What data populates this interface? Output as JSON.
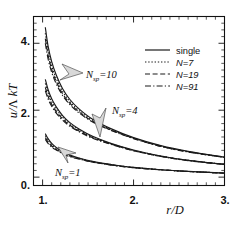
{
  "chart_data": {
    "type": "line",
    "title": "",
    "xlabel": "r/D",
    "ylabel": "u/Λ kT",
    "xlim": [
      0.9,
      3.0
    ],
    "ylim": [
      -0.25,
      4.8
    ],
    "xticks": [
      "1.",
      "2.",
      "3."
    ],
    "xtick_values": [
      1,
      2,
      3
    ],
    "yticks": [
      "0.",
      "2.",
      "4."
    ],
    "ytick_values": [
      0,
      2,
      4
    ],
    "grid": false,
    "legend_position": "upper-right",
    "minor_ticks": true,
    "legend": [
      {
        "label": "single",
        "style": "solid"
      },
      {
        "label": "N=7",
        "style": "dotted"
      },
      {
        "label": "N=19",
        "style": "dashed"
      },
      {
        "label": "N=91",
        "style": "dashdot"
      }
    ],
    "annotations": [
      {
        "text": "N",
        "sub": "sp",
        "eq": "=10",
        "x": 1.42,
        "y": 2.92
      },
      {
        "text": "N",
        "sub": "sp",
        "eq": "=4",
        "x": 2.02,
        "y": 1.88
      },
      {
        "text": "N",
        "sub": "sp",
        "eq": "=1",
        "x": 1.22,
        "y": 0.3
      }
    ],
    "series": [
      {
        "name": "Nsp=10, single",
        "group": "Nsp=10",
        "style": "solid",
        "x": [
          1.03,
          1.06,
          1.1,
          1.15,
          1.22,
          1.3,
          1.4,
          1.55,
          1.75,
          2.0,
          2.3,
          2.6,
          3.0
        ],
        "y": [
          4.48,
          3.92,
          3.45,
          3.05,
          2.64,
          2.32,
          2.04,
          1.73,
          1.45,
          1.18,
          0.94,
          0.77,
          0.6
        ]
      },
      {
        "name": "Nsp=10, N=7",
        "group": "Nsp=10",
        "style": "dotted",
        "x": [
          1.03,
          1.06,
          1.1,
          1.15,
          1.22,
          1.3,
          1.4,
          1.55,
          1.75,
          2.0,
          2.3,
          2.6,
          3.0
        ],
        "y": [
          4.3,
          3.78,
          3.33,
          2.95,
          2.56,
          2.26,
          1.99,
          1.7,
          1.43,
          1.17,
          0.93,
          0.76,
          0.59
        ]
      },
      {
        "name": "Nsp=10, N=19",
        "group": "Nsp=10",
        "style": "dashed",
        "x": [
          1.03,
          1.06,
          1.1,
          1.15,
          1.22,
          1.3,
          1.4,
          1.55,
          1.75,
          2.0,
          2.3,
          2.6,
          3.0
        ],
        "y": [
          4.14,
          3.65,
          3.22,
          2.86,
          2.49,
          2.21,
          1.95,
          1.67,
          1.41,
          1.16,
          0.92,
          0.76,
          0.59
        ]
      },
      {
        "name": "Nsp=10, N=91",
        "group": "Nsp=10",
        "style": "dashdot",
        "x": [
          1.03,
          1.06,
          1.1,
          1.15,
          1.22,
          1.3,
          1.4,
          1.55,
          1.75,
          2.0,
          2.3,
          2.6,
          3.0
        ],
        "y": [
          4.0,
          3.54,
          3.13,
          2.79,
          2.44,
          2.17,
          1.92,
          1.65,
          1.4,
          1.15,
          0.92,
          0.75,
          0.59
        ]
      },
      {
        "name": "Nsp=4, single",
        "group": "Nsp=4",
        "style": "solid",
        "x": [
          1.03,
          1.06,
          1.1,
          1.15,
          1.22,
          1.3,
          1.4,
          1.55,
          1.75,
          2.0,
          2.3,
          2.6,
          3.0
        ],
        "y": [
          2.92,
          2.62,
          2.34,
          2.1,
          1.84,
          1.63,
          1.44,
          1.22,
          1.01,
          0.81,
          0.63,
          0.5,
          0.38
        ]
      },
      {
        "name": "Nsp=4, N=7",
        "group": "Nsp=4",
        "style": "dotted",
        "x": [
          1.03,
          1.06,
          1.1,
          1.15,
          1.22,
          1.3,
          1.4,
          1.55,
          1.75,
          2.0,
          2.3,
          2.6,
          3.0
        ],
        "y": [
          2.8,
          2.52,
          2.26,
          2.03,
          1.79,
          1.59,
          1.41,
          1.2,
          1.0,
          0.8,
          0.63,
          0.5,
          0.38
        ]
      },
      {
        "name": "Nsp=4, N=19",
        "group": "Nsp=4",
        "style": "dashed",
        "x": [
          1.03,
          1.06,
          1.1,
          1.15,
          1.22,
          1.3,
          1.4,
          1.55,
          1.75,
          2.0,
          2.3,
          2.6,
          3.0
        ],
        "y": [
          2.68,
          2.42,
          2.18,
          1.96,
          1.74,
          1.55,
          1.38,
          1.18,
          0.99,
          0.79,
          0.62,
          0.5,
          0.38
        ]
      },
      {
        "name": "Nsp=4, N=91",
        "group": "Nsp=4",
        "style": "dashdot",
        "x": [
          1.03,
          1.06,
          1.1,
          1.15,
          1.22,
          1.3,
          1.4,
          1.55,
          1.75,
          2.0,
          2.3,
          2.6,
          3.0
        ],
        "y": [
          2.58,
          2.34,
          2.12,
          1.91,
          1.7,
          1.52,
          1.36,
          1.16,
          0.98,
          0.79,
          0.62,
          0.49,
          0.38
        ]
      },
      {
        "name": "Nsp=1, single",
        "group": "Nsp=1",
        "style": "solid",
        "x": [
          1.03,
          1.06,
          1.1,
          1.15,
          1.22,
          1.3,
          1.4,
          1.55,
          1.75,
          2.0,
          2.3,
          2.6,
          3.0
        ],
        "y": [
          1.3,
          1.15,
          1.01,
          0.89,
          0.76,
          0.66,
          0.57,
          0.47,
          0.38,
          0.29,
          0.22,
          0.17,
          0.12
        ]
      },
      {
        "name": "Nsp=1, N=7",
        "group": "Nsp=1",
        "style": "dotted",
        "x": [
          1.03,
          1.06,
          1.1,
          1.15,
          1.22,
          1.3,
          1.4,
          1.55,
          1.75,
          2.0,
          2.3,
          2.6,
          3.0
        ],
        "y": [
          1.24,
          1.1,
          0.97,
          0.86,
          0.74,
          0.64,
          0.56,
          0.46,
          0.37,
          0.29,
          0.22,
          0.17,
          0.12
        ]
      },
      {
        "name": "Nsp=1, N=19",
        "group": "Nsp=1",
        "style": "dashed",
        "x": [
          1.03,
          1.06,
          1.1,
          1.15,
          1.22,
          1.3,
          1.4,
          1.55,
          1.75,
          2.0,
          2.3,
          2.6,
          3.0
        ],
        "y": [
          1.18,
          1.05,
          0.93,
          0.83,
          0.72,
          0.63,
          0.55,
          0.45,
          0.37,
          0.28,
          0.22,
          0.17,
          0.12
        ]
      },
      {
        "name": "Nsp=1, N=91",
        "group": "Nsp=1",
        "style": "dashdot",
        "x": [
          1.03,
          1.06,
          1.1,
          1.15,
          1.22,
          1.3,
          1.4,
          1.55,
          1.75,
          2.0,
          2.3,
          2.6,
          3.0
        ],
        "y": [
          1.13,
          1.01,
          0.9,
          0.81,
          0.7,
          0.61,
          0.54,
          0.45,
          0.36,
          0.28,
          0.22,
          0.17,
          0.12
        ]
      }
    ]
  },
  "axes": {
    "y_label_u": "u",
    "y_label_slash": "/",
    "y_label_lambda": "Λ",
    "y_label_kT": "kT",
    "x_label": "r/D"
  },
  "colors": {
    "ink": "#1a1a1a",
    "background": "#ffffff",
    "arrow_fill": "#d8d8d8"
  }
}
